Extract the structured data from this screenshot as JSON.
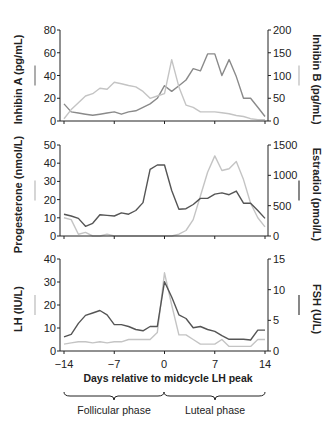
{
  "colors": {
    "dark_series": "#555555",
    "mid_series": "#8a8a8a",
    "light_series": "#c4c4c4",
    "axis": "#222222"
  },
  "xaxis": {
    "label": "Days relative to midcycle LH peak",
    "ticks": [
      "−14",
      "−7",
      "0",
      "7",
      "14"
    ],
    "tick_values": [
      -14,
      -7,
      0,
      7,
      14
    ]
  },
  "phases": {
    "follicular": "Follicular phase",
    "luteal": "Luteal phase"
  },
  "chart_data": [
    {
      "type": "line",
      "panel": "top",
      "x": [
        -14,
        -13,
        -12,
        -11,
        -10,
        -9,
        -8,
        -7,
        -6,
        -5,
        -4,
        -3,
        -2,
        -1,
        0,
        1,
        2,
        3,
        4,
        5,
        6,
        7,
        8,
        9,
        10,
        11,
        12,
        13,
        14
      ],
      "left_axis": {
        "label": "Inhibin A (pg/mL)",
        "ylim": [
          0,
          80
        ],
        "ticks": [
          "0",
          "20",
          "40",
          "60",
          "80"
        ]
      },
      "right_axis": {
        "label": "Inhibin B (pg/mL)",
        "ylim": [
          0,
          200
        ],
        "ticks": [
          "0",
          "50",
          "100",
          "150",
          "200"
        ]
      },
      "series": [
        {
          "name": "Inhibin A",
          "axis": "left",
          "color": "mid",
          "values": [
            15,
            8,
            7,
            6,
            5,
            6,
            7,
            8,
            6,
            8,
            9,
            12,
            15,
            20,
            31,
            26,
            31,
            36,
            46,
            44,
            59,
            59,
            40,
            54,
            39,
            20,
            20,
            12,
            4
          ]
        },
        {
          "name": "Inhibin B",
          "axis": "right",
          "color": "light",
          "values": [
            5,
            25,
            40,
            55,
            60,
            72,
            70,
            85,
            82,
            78,
            75,
            65,
            50,
            55,
            60,
            135,
            75,
            35,
            30,
            20,
            20,
            20,
            18,
            16,
            12,
            10,
            5,
            3,
            3
          ]
        }
      ]
    },
    {
      "type": "line",
      "panel": "middle",
      "x": [
        -14,
        -13,
        -12,
        -11,
        -10,
        -9,
        -8,
        -7,
        -6,
        -5,
        -4,
        -3,
        -2,
        -1,
        0,
        1,
        2,
        3,
        4,
        5,
        6,
        7,
        8,
        9,
        10,
        11,
        12,
        13,
        14
      ],
      "left_axis": {
        "label": "Progesterone (nmol/L)",
        "ylim": [
          0,
          50
        ],
        "ticks": [
          "0",
          "10",
          "20",
          "30",
          "40",
          "50"
        ]
      },
      "right_axis": {
        "label": "Estradiol (pmol/L)",
        "ylim": [
          0,
          1500
        ],
        "ticks": [
          "0",
          "500",
          "1000",
          "1500"
        ]
      },
      "series": [
        {
          "name": "Progesterone",
          "axis": "left",
          "color": "light",
          "values": [
            10,
            9,
            1,
            2,
            0,
            0,
            1,
            0,
            0,
            0,
            0,
            0,
            0,
            0,
            0,
            0,
            1,
            3,
            9,
            22,
            35,
            44,
            36,
            37,
            41,
            31,
            18,
            10,
            5
          ]
        },
        {
          "name": "Estradiol",
          "axis": "right",
          "color": "dark",
          "values": [
            360,
            330,
            290,
            160,
            210,
            350,
            340,
            330,
            380,
            360,
            420,
            550,
            1100,
            1170,
            1170,
            750,
            440,
            450,
            520,
            620,
            620,
            690,
            710,
            680,
            740,
            540,
            540,
            420,
            290
          ]
        }
      ]
    },
    {
      "type": "line",
      "panel": "bottom",
      "x": [
        -14,
        -13,
        -12,
        -11,
        -10,
        -9,
        -8,
        -7,
        -6,
        -5,
        -4,
        -3,
        -2,
        -1,
        0,
        1,
        2,
        3,
        4,
        5,
        6,
        7,
        8,
        9,
        10,
        11,
        12,
        13,
        14
      ],
      "left_axis": {
        "label": "LH (IU/L)",
        "ylim": [
          0,
          40
        ],
        "ticks": [
          "0",
          "10",
          "20",
          "30",
          "40"
        ]
      },
      "right_axis": {
        "label": "FSH (U/L)",
        "ylim": [
          0,
          15
        ],
        "ticks": [
          "0",
          "5",
          "10",
          "15"
        ]
      },
      "series": [
        {
          "name": "LH",
          "axis": "left",
          "color": "light",
          "values": [
            3,
            3.5,
            4,
            4,
            3.5,
            4,
            3.5,
            4,
            4,
            5,
            5,
            5,
            5,
            8,
            34,
            20,
            7,
            7,
            5,
            3,
            3,
            3,
            5,
            2,
            2,
            2,
            2,
            5,
            5
          ]
        },
        {
          "name": "FSH",
          "axis": "right",
          "color": "dark",
          "values": [
            2.3,
            2.7,
            4.5,
            5.8,
            6.2,
            6.6,
            5.9,
            4.3,
            4.3,
            4.0,
            3.5,
            3.3,
            4.0,
            4.0,
            11.3,
            8.8,
            5.9,
            5.3,
            3.8,
            4.0,
            3.5,
            3.2,
            2.5,
            1.9,
            1.9,
            1.9,
            1.8,
            3.4,
            3.4
          ]
        }
      ]
    }
  ]
}
